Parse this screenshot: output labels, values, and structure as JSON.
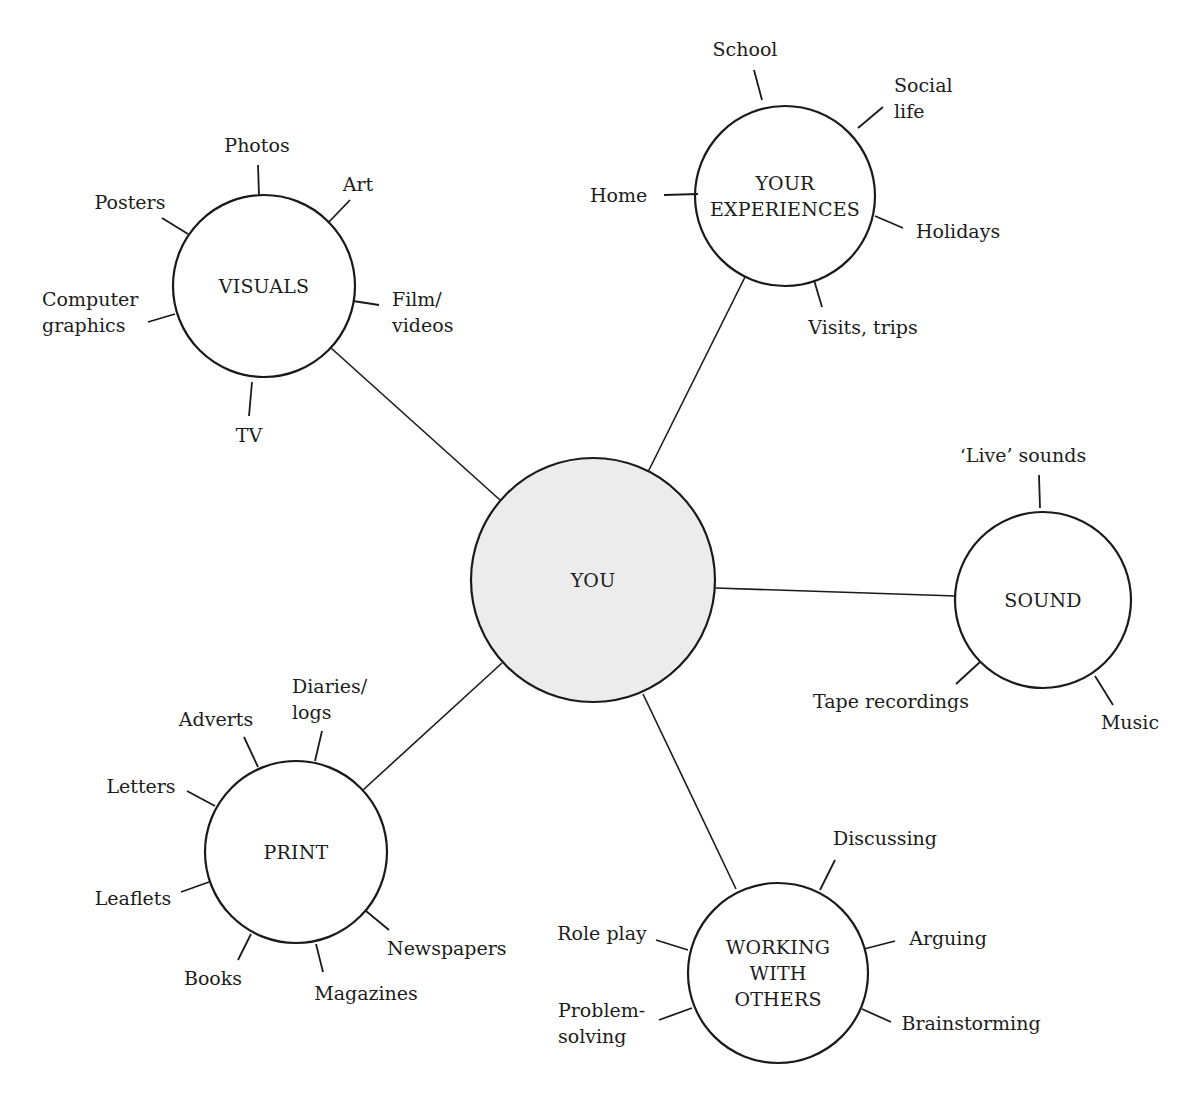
{
  "diagram": {
    "type": "mind-map",
    "colors": {
      "line": "#1a1a1a",
      "hub_fill": "#ececec",
      "node_fill": "#ffffff",
      "text": "#1c1c1c"
    },
    "center": {
      "id": "you",
      "label": "YOU",
      "cx": 593,
      "cy": 580,
      "r": 122
    },
    "nodes": [
      {
        "id": "visuals",
        "label_lines": [
          "VISUALS"
        ],
        "cx": 264,
        "cy": 286,
        "r": 91,
        "link": {
          "x1": 500,
          "y1": 500,
          "x2": 331,
          "y2": 348
        },
        "leaves": [
          {
            "label_lines": [
              "Photos"
            ],
            "tick": [
              258,
              165,
              259,
              196
            ],
            "text": [
              257,
              152
            ],
            "anchor": "middle"
          },
          {
            "label_lines": [
              "Art"
            ],
            "tick": [
              350,
              200,
              328,
              223
            ],
            "text": [
              358,
              191
            ],
            "anchor": "middle"
          },
          {
            "label_lines": [
              "Posters"
            ],
            "tick": [
              162,
              218,
              188,
              234
            ],
            "text": [
              130,
              209
            ],
            "anchor": "middle"
          },
          {
            "label_lines": [
              "Computer",
              "graphics"
            ],
            "tick": [
              148,
              322,
              175,
              314
            ],
            "text": [
              42,
              306
            ],
            "anchor": "start"
          },
          {
            "label_lines": [
              "Film/",
              "videos"
            ],
            "tick": [
              353,
              301,
              379,
              305
            ],
            "text": [
              392,
              306
            ],
            "anchor": "start"
          },
          {
            "label_lines": [
              "TV"
            ],
            "tick": [
              252,
              382,
              249,
              416
            ],
            "text": [
              249,
              442
            ],
            "anchor": "middle"
          }
        ]
      },
      {
        "id": "your-experiences",
        "label_lines": [
          "YOUR",
          "EXPERIENCES"
        ],
        "cx": 785,
        "cy": 196,
        "r": 90,
        "link": {
          "x1": 646,
          "y1": 476,
          "x2": 747,
          "y2": 273
        },
        "leaves": [
          {
            "label_lines": [
              "School"
            ],
            "tick": [
              754,
              70,
              762,
              100
            ],
            "text": [
              745,
              56
            ],
            "anchor": "middle"
          },
          {
            "label_lines": [
              "Social",
              "life"
            ],
            "tick": [
              883,
              107,
              858,
              128
            ],
            "text": [
              894,
              92
            ],
            "anchor": "start"
          },
          {
            "label_lines": [
              "Home"
            ],
            "tick": [
              664,
              195,
              698,
              194
            ],
            "text": [
              590,
              202
            ],
            "anchor": "start"
          },
          {
            "label_lines": [
              "Holidays"
            ],
            "tick": [
              875,
              216,
              903,
              228
            ],
            "text": [
              916,
              238
            ],
            "anchor": "start"
          },
          {
            "label_lines": [
              "Visits, trips"
            ],
            "tick": [
              814,
              280,
              822,
              307
            ],
            "text": [
              863,
              334
            ],
            "anchor": "middle"
          }
        ]
      },
      {
        "id": "sound",
        "label_lines": [
          "SOUND"
        ],
        "cx": 1043,
        "cy": 600,
        "r": 88,
        "link": {
          "x1": 715,
          "y1": 588,
          "x2": 956,
          "y2": 596
        },
        "leaves": [
          {
            "label_lines": [
              "‘Live’ sounds"
            ],
            "tick": [
              1039,
              475,
              1040,
              508
            ],
            "text": [
              1023,
              462
            ],
            "anchor": "middle"
          },
          {
            "label_lines": [
              "Tape recordings"
            ],
            "tick": [
              980,
              662,
              956,
              684
            ],
            "text": [
              891,
              708
            ],
            "anchor": "middle"
          },
          {
            "label_lines": [
              "Music"
            ],
            "tick": [
              1095,
              676,
              1113,
              705
            ],
            "text": [
              1130,
              729
            ],
            "anchor": "middle"
          }
        ]
      },
      {
        "id": "print",
        "label_lines": [
          "PRINT"
        ],
        "cx": 296,
        "cy": 852,
        "r": 91,
        "link": {
          "x1": 502,
          "y1": 663,
          "x2": 363,
          "y2": 790
        },
        "leaves": [
          {
            "label_lines": [
              "Diaries/",
              "logs"
            ],
            "tick": [
              322,
              731,
              315,
              761
            ],
            "text": [
              292,
              693
            ],
            "anchor": "start"
          },
          {
            "label_lines": [
              "Adverts"
            ],
            "tick": [
              244,
              737,
              258,
              767
            ],
            "text": [
              216,
              726
            ],
            "anchor": "middle"
          },
          {
            "label_lines": [
              "Letters"
            ],
            "tick": [
              187,
              791,
              215,
              806
            ],
            "text": [
              141,
              793
            ],
            "anchor": "middle"
          },
          {
            "label_lines": [
              "Leaflets"
            ],
            "tick": [
              181,
              892,
              209,
              882
            ],
            "text": [
              133,
              905
            ],
            "anchor": "middle"
          },
          {
            "label_lines": [
              "Books"
            ],
            "tick": [
              238,
              960,
              251,
              934
            ],
            "text": [
              213,
              985
            ],
            "anchor": "middle"
          },
          {
            "label_lines": [
              "Magazines"
            ],
            "tick": [
              316,
              944,
              323,
              972
            ],
            "text": [
              366,
              1000
            ],
            "anchor": "middle"
          },
          {
            "label_lines": [
              "Newspapers"
            ],
            "tick": [
              366,
              911,
              389,
              930
            ],
            "text": [
              387,
              955
            ],
            "anchor": "start"
          }
        ]
      },
      {
        "id": "working-with-others",
        "label_lines": [
          "WORKING",
          "WITH",
          "OTHERS"
        ],
        "cx": 778,
        "cy": 973,
        "r": 90,
        "link": {
          "x1": 643,
          "y1": 694,
          "x2": 736,
          "y2": 889
        },
        "leaves": [
          {
            "label_lines": [
              "Discussing"
            ],
            "tick": [
              835,
              860,
              820,
              890
            ],
            "text": [
              885,
              845
            ],
            "anchor": "middle"
          },
          {
            "label_lines": [
              "Role play"
            ],
            "tick": [
              656,
              940,
              688,
              950
            ],
            "text": [
              602,
              940
            ],
            "anchor": "middle"
          },
          {
            "label_lines": [
              "Arguing"
            ],
            "tick": [
              864,
              949,
              895,
              941
            ],
            "text": [
              948,
              945
            ],
            "anchor": "middle"
          },
          {
            "label_lines": [
              "Problem-",
              "solving"
            ],
            "tick": [
              659,
              1020,
              692,
              1008
            ],
            "text": [
              558,
              1017
            ],
            "anchor": "start"
          },
          {
            "label_lines": [
              "Brainstorming"
            ],
            "tick": [
              862,
              1009,
              891,
              1022
            ],
            "text": [
              971,
              1030
            ],
            "anchor": "middle"
          }
        ]
      }
    ]
  }
}
